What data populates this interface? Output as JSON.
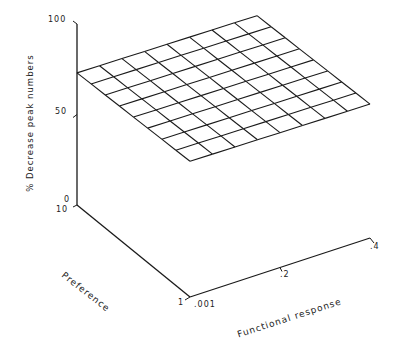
{
  "chart_data": {
    "type": "surface3d",
    "title": "",
    "zlabel": "% Decrease peak numbers",
    "xlabel": "Functional response",
    "ylabel": "Preference",
    "z_ticks": [
      "0",
      "50",
      "100"
    ],
    "x_ticks": [
      ".001",
      ".2",
      ".4"
    ],
    "y_ticks": [
      "10",
      "1"
    ],
    "zlim": [
      0,
      100
    ],
    "xlim": [
      0.001,
      0.4
    ],
    "ylim": [
      1,
      10
    ],
    "grid_size": [
      8,
      8
    ],
    "surface_corners": [
      {
        "preference": 10,
        "functional_response": 0.001,
        "z": 73
      },
      {
        "preference": 10,
        "functional_response": 0.4,
        "z": 72
      },
      {
        "preference": 1,
        "functional_response": 0.4,
        "z": 74
      },
      {
        "preference": 1,
        "functional_response": 0.001,
        "z": 75
      }
    ],
    "grid": "off",
    "legend": "none"
  },
  "labels": {
    "z_axis": "% Decrease peak numbers",
    "x_axis": "Functional response",
    "y_axis": "Preference",
    "z100": "100",
    "z50": "50",
    "z0": "0",
    "y10": "10",
    "y1": "1",
    "x001": ".001",
    "x2": ".2",
    "x4": ".4"
  }
}
